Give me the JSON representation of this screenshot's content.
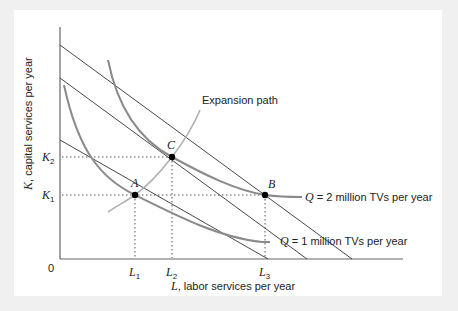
{
  "figure": {
    "type": "isoquant-isocost expansion path diagram",
    "axes": {
      "origin_label": "0",
      "x_axis_label_var": "L",
      "x_axis_label_text": ", labor services per year",
      "y_axis_label_var": "K",
      "y_axis_label_text": ", capital services per year"
    },
    "x_ticks": [
      {
        "var": "L",
        "sub": "1"
      },
      {
        "var": "L",
        "sub": "2"
      },
      {
        "var": "L",
        "sub": "3"
      }
    ],
    "y_ticks": [
      {
        "var": "K",
        "sub": "2"
      },
      {
        "var": "K",
        "sub": "1"
      }
    ],
    "points": [
      {
        "label": "A"
      },
      {
        "label": "C"
      },
      {
        "label": "B"
      }
    ],
    "isoquants": [
      {
        "var": "Q",
        "text": " = 1 million TVs per year"
      },
      {
        "var": "Q",
        "text": " = 2 million TVs per year"
      }
    ],
    "expansion_path_label": "Expansion path",
    "isocost_lines": 3
  },
  "colors": {
    "background": "#f0f0f0",
    "panel": "#ffffff",
    "axis": "#555555",
    "isocost": "#333333",
    "isoquant": "#808080",
    "expansion_path": "#a8a8a8",
    "point": "#000000"
  }
}
